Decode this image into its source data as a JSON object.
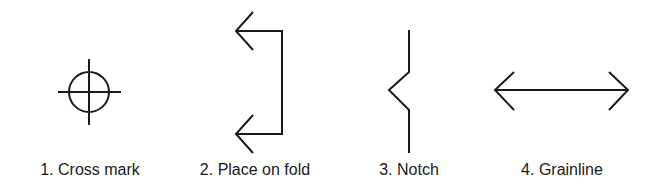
{
  "diagram": {
    "stroke_color": "#1a1a1a",
    "symbols": [
      {
        "number": "1",
        "name": "Cross mark",
        "label": "1. Cross mark",
        "icon": "cross-mark-icon"
      },
      {
        "number": "2",
        "name": "Place on fold",
        "label": "2. Place on fold",
        "icon": "place-on-fold-icon"
      },
      {
        "number": "3",
        "name": "Notch",
        "label": "3. Notch",
        "icon": "notch-icon"
      },
      {
        "number": "4",
        "name": "Grainline",
        "label": "4. Grainline",
        "icon": "grainline-icon"
      }
    ]
  }
}
